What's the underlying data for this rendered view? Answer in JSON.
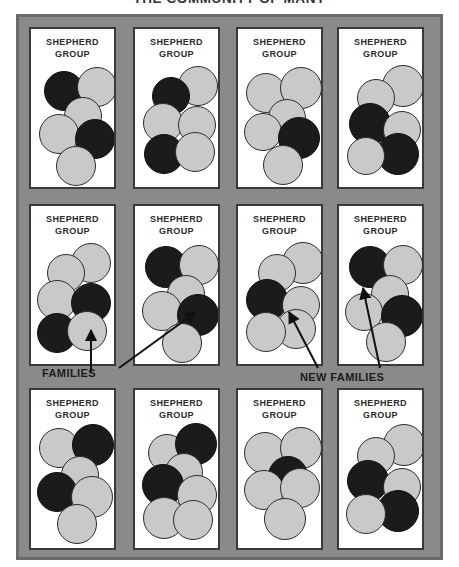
{
  "title": "THE COMMUNITY OF MANY",
  "colors": {
    "frame_fill": "#8a8a8a",
    "frame_border": "#6b6b6b",
    "panel_fill": "#ffffff",
    "panel_border": "#3a3a3a",
    "circle_light": "#c9c9c9",
    "circle_dark": "#1b1b1b",
    "text": "#2b2b2b"
  },
  "group_label": {
    "line1": "SHEPHERD",
    "line2": "GROUP"
  },
  "annotations": [
    {
      "id": "families",
      "label": "FAMILIES"
    },
    {
      "id": "new-families",
      "label": "NEW FAMILIES"
    }
  ],
  "legend": {
    "light_circle_meaning": "FAMILIES",
    "dark_circle_meaning": "NEW FAMILIES"
  },
  "grid": {
    "rows": 3,
    "columns": 4,
    "total_panels": 12
  },
  "panels": [
    {
      "row": 1,
      "col": 1,
      "dark_count": 2,
      "light_count": 4,
      "circles": [
        {
          "type": "dark",
          "x": 13,
          "y": 42,
          "d": 40
        },
        {
          "type": "light",
          "x": 46,
          "y": 38,
          "d": 40
        },
        {
          "type": "light",
          "x": 33,
          "y": 68,
          "d": 38
        },
        {
          "type": "light",
          "x": 8,
          "y": 85,
          "d": 40
        },
        {
          "type": "dark",
          "x": 44,
          "y": 90,
          "d": 40
        },
        {
          "type": "light",
          "x": 25,
          "y": 117,
          "d": 40
        }
      ]
    },
    {
      "row": 1,
      "col": 2,
      "dark_count": 2,
      "light_count": 4,
      "circles": [
        {
          "type": "light",
          "x": 43,
          "y": 37,
          "d": 40
        },
        {
          "type": "dark",
          "x": 17,
          "y": 48,
          "d": 38
        },
        {
          "type": "light",
          "x": 8,
          "y": 74,
          "d": 40
        },
        {
          "type": "light",
          "x": 43,
          "y": 77,
          "d": 38
        },
        {
          "type": "dark",
          "x": 9,
          "y": 105,
          "d": 40
        },
        {
          "type": "light",
          "x": 40,
          "y": 103,
          "d": 40
        }
      ]
    },
    {
      "row": 1,
      "col": 3,
      "dark_count": 1,
      "light_count": 5,
      "circles": [
        {
          "type": "light",
          "x": 8,
          "y": 44,
          "d": 40
        },
        {
          "type": "light",
          "x": 42,
          "y": 38,
          "d": 42
        },
        {
          "type": "light",
          "x": 30,
          "y": 70,
          "d": 38
        },
        {
          "type": "light",
          "x": 6,
          "y": 84,
          "d": 38
        },
        {
          "type": "dark",
          "x": 40,
          "y": 88,
          "d": 42
        },
        {
          "type": "light",
          "x": 25,
          "y": 116,
          "d": 40
        }
      ]
    },
    {
      "row": 1,
      "col": 4,
      "dark_count": 2,
      "light_count": 4,
      "circles": [
        {
          "type": "light",
          "x": 43,
          "y": 36,
          "d": 42
        },
        {
          "type": "light",
          "x": 18,
          "y": 50,
          "d": 38
        },
        {
          "type": "dark",
          "x": 10,
          "y": 74,
          "d": 42
        },
        {
          "type": "light",
          "x": 44,
          "y": 82,
          "d": 38
        },
        {
          "type": "dark",
          "x": 38,
          "y": 104,
          "d": 42
        },
        {
          "type": "light",
          "x": 8,
          "y": 108,
          "d": 38
        }
      ]
    },
    {
      "row": 2,
      "col": 1,
      "dark_count": 2,
      "light_count": 4,
      "circles": [
        {
          "type": "light",
          "x": 40,
          "y": 37,
          "d": 40
        },
        {
          "type": "light",
          "x": 16,
          "y": 48,
          "d": 38
        },
        {
          "type": "light",
          "x": 6,
          "y": 74,
          "d": 40
        },
        {
          "type": "dark",
          "x": 40,
          "y": 77,
          "d": 40
        },
        {
          "type": "dark",
          "x": 6,
          "y": 107,
          "d": 40
        },
        {
          "type": "light",
          "x": 36,
          "y": 105,
          "d": 40
        }
      ]
    },
    {
      "row": 2,
      "col": 2,
      "dark_count": 2,
      "light_count": 4,
      "circles": [
        {
          "type": "dark",
          "x": 10,
          "y": 40,
          "d": 42
        },
        {
          "type": "light",
          "x": 44,
          "y": 39,
          "d": 40
        },
        {
          "type": "light",
          "x": 32,
          "y": 69,
          "d": 38
        },
        {
          "type": "light",
          "x": 7,
          "y": 85,
          "d": 40
        },
        {
          "type": "dark",
          "x": 42,
          "y": 88,
          "d": 42
        },
        {
          "type": "light",
          "x": 27,
          "y": 117,
          "d": 40
        }
      ]
    },
    {
      "row": 2,
      "col": 3,
      "dark_count": 1,
      "light_count": 5,
      "circles": [
        {
          "type": "light",
          "x": 44,
          "y": 36,
          "d": 42
        },
        {
          "type": "light",
          "x": 20,
          "y": 48,
          "d": 38
        },
        {
          "type": "dark",
          "x": 8,
          "y": 73,
          "d": 42
        },
        {
          "type": "light",
          "x": 44,
          "y": 80,
          "d": 38
        },
        {
          "type": "light",
          "x": 38,
          "y": 103,
          "d": 40
        },
        {
          "type": "light",
          "x": 8,
          "y": 106,
          "d": 40
        }
      ]
    },
    {
      "row": 2,
      "col": 4,
      "dark_count": 2,
      "light_count": 4,
      "circles": [
        {
          "type": "dark",
          "x": 10,
          "y": 40,
          "d": 42
        },
        {
          "type": "light",
          "x": 44,
          "y": 39,
          "d": 40
        },
        {
          "type": "light",
          "x": 32,
          "y": 69,
          "d": 38
        },
        {
          "type": "light",
          "x": 6,
          "y": 87,
          "d": 38
        },
        {
          "type": "dark",
          "x": 42,
          "y": 89,
          "d": 42
        },
        {
          "type": "light",
          "x": 27,
          "y": 116,
          "d": 40
        }
      ]
    },
    {
      "row": 3,
      "col": 1,
      "dark_count": 2,
      "light_count": 4,
      "circles": [
        {
          "type": "light",
          "x": 8,
          "y": 38,
          "d": 40
        },
        {
          "type": "dark",
          "x": 41,
          "y": 34,
          "d": 42
        },
        {
          "type": "light",
          "x": 30,
          "y": 66,
          "d": 38
        },
        {
          "type": "dark",
          "x": 6,
          "y": 82,
          "d": 40
        },
        {
          "type": "light",
          "x": 40,
          "y": 86,
          "d": 42
        },
        {
          "type": "light",
          "x": 26,
          "y": 114,
          "d": 40
        }
      ]
    },
    {
      "row": 3,
      "col": 2,
      "dark_count": 2,
      "light_count": 4,
      "circles": [
        {
          "type": "light",
          "x": 13,
          "y": 44,
          "d": 38
        },
        {
          "type": "dark",
          "x": 40,
          "y": 33,
          "d": 42
        },
        {
          "type": "light",
          "x": 30,
          "y": 63,
          "d": 38
        },
        {
          "type": "dark",
          "x": 7,
          "y": 74,
          "d": 42
        },
        {
          "type": "light",
          "x": 42,
          "y": 85,
          "d": 40
        },
        {
          "type": "light",
          "x": 8,
          "y": 107,
          "d": 42
        },
        {
          "type": "light",
          "x": 38,
          "y": 110,
          "d": 40
        }
      ]
    },
    {
      "row": 3,
      "col": 3,
      "dark_count": 1,
      "light_count": 5,
      "circles": [
        {
          "type": "light",
          "x": 6,
          "y": 42,
          "d": 42
        },
        {
          "type": "light",
          "x": 42,
          "y": 37,
          "d": 42
        },
        {
          "type": "dark",
          "x": 30,
          "y": 66,
          "d": 40
        },
        {
          "type": "light",
          "x": 6,
          "y": 80,
          "d": 40
        },
        {
          "type": "light",
          "x": 42,
          "y": 78,
          "d": 40
        },
        {
          "type": "light",
          "x": 26,
          "y": 108,
          "d": 42
        }
      ]
    },
    {
      "row": 3,
      "col": 4,
      "dark_count": 2,
      "light_count": 4,
      "circles": [
        {
          "type": "light",
          "x": 44,
          "y": 34,
          "d": 42
        },
        {
          "type": "light",
          "x": 18,
          "y": 47,
          "d": 38
        },
        {
          "type": "dark",
          "x": 8,
          "y": 70,
          "d": 42
        },
        {
          "type": "light",
          "x": 44,
          "y": 78,
          "d": 38
        },
        {
          "type": "dark",
          "x": 38,
          "y": 100,
          "d": 42
        },
        {
          "type": "light",
          "x": 7,
          "y": 104,
          "d": 40
        }
      ]
    }
  ]
}
